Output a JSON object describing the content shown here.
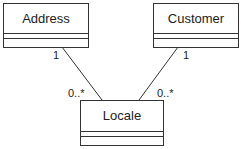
{
  "diagram": {
    "type": "UML class diagram",
    "classes": [
      {
        "name": "Address"
      },
      {
        "name": "Customer"
      },
      {
        "name": "Locale"
      }
    ],
    "associations": [
      {
        "from": "Address",
        "to": "Locale",
        "from_multiplicity": "1",
        "to_multiplicity": "0..*"
      },
      {
        "from": "Customer",
        "to": "Locale",
        "from_multiplicity": "1",
        "to_multiplicity": "0..*"
      }
    ]
  }
}
